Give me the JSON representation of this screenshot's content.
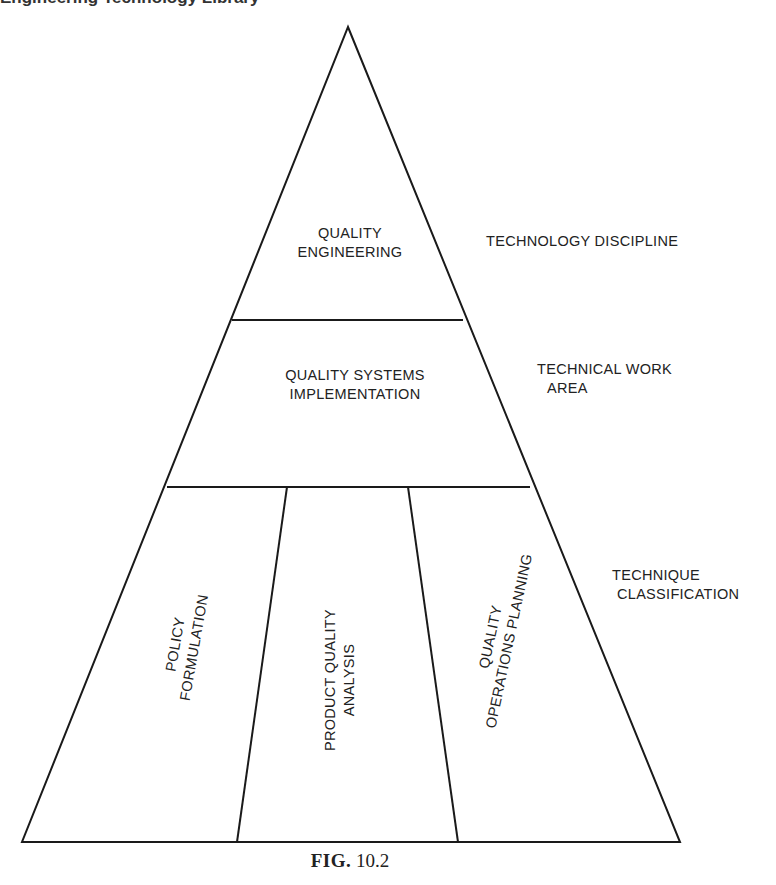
{
  "header_fragment": "Engineering Technology Library",
  "pyramid": {
    "tiers": [
      {
        "level": "top",
        "lines": [
          "QUALITY",
          "ENGINEERING"
        ],
        "side_label": [
          "TECHNOLOGY DISCIPLINE"
        ]
      },
      {
        "level": "middle",
        "lines": [
          "QUALITY SYSTEMS",
          "IMPLEMENTATION"
        ],
        "side_label": [
          "TECHNICAL WORK",
          "AREA"
        ]
      },
      {
        "level": "bottom",
        "side_label": [
          "TECHNIQUE",
          "CLASSIFICATION"
        ],
        "sections": [
          {
            "lines": [
              "POLICY",
              "FORMULATION"
            ]
          },
          {
            "lines": [
              "PRODUCT QUALITY",
              "ANALYSIS"
            ]
          },
          {
            "lines": [
              "QUALITY",
              "OPERATIONS PLANNING"
            ]
          }
        ]
      }
    ],
    "stroke_color": "#1a1a1a"
  },
  "caption": {
    "prefix": "FIG.",
    "number": "10.2"
  }
}
